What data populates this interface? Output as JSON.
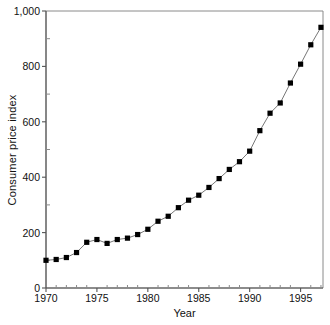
{
  "chart_data": {
    "type": "line",
    "title": "",
    "xlabel": "Year",
    "ylabel": "Consumer price index",
    "xlim": [
      1970,
      1997.2
    ],
    "ylim": [
      0,
      1000
    ],
    "grid": false,
    "legend": null,
    "marker": "filled-square",
    "line_color": "#777777",
    "marker_color": "#000000",
    "x": [
      1970,
      1971,
      1972,
      1973,
      1974,
      1975,
      1976,
      1977,
      1978,
      1979,
      1980,
      1981,
      1982,
      1983,
      1984,
      1985,
      1986,
      1987,
      1988,
      1989,
      1990,
      1991,
      1992,
      1993,
      1994,
      1995,
      1996,
      1997
    ],
    "values": [
      100,
      103,
      110,
      128,
      165,
      175,
      161,
      175,
      180,
      193,
      212,
      241,
      259,
      290,
      317,
      335,
      363,
      395,
      428,
      456,
      494,
      568,
      631,
      668,
      740,
      808,
      878,
      941
    ],
    "xticks": [
      1970,
      1975,
      1980,
      1985,
      1990,
      1995
    ],
    "xtick_labels": [
      "1970",
      "1975",
      "1980",
      "1985",
      "1990",
      "1995"
    ],
    "xminor_tick_step": 1,
    "yticks": [
      0,
      200,
      400,
      600,
      800,
      1000
    ],
    "ytick_labels": [
      "0",
      "200",
      "400",
      "600",
      "800",
      "1,000"
    ],
    "yminor_tick_step": 100
  }
}
